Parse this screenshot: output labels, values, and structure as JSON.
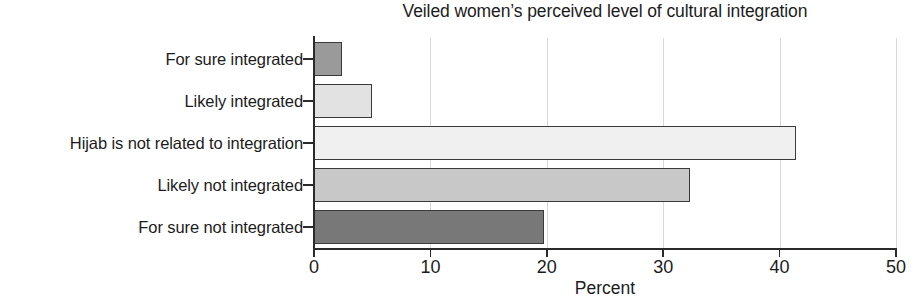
{
  "chart_data": {
    "type": "bar",
    "orientation": "horizontal",
    "title": "Veiled women’s perceived level of cultural integration",
    "xlabel": "Percent",
    "ylabel": "",
    "categories": [
      "For sure integrated",
      "Likely integrated",
      "Hijab is not related to integration",
      "Likely not integrated",
      "For sure not integrated"
    ],
    "values": [
      2.4,
      5.0,
      41.4,
      32.3,
      19.8
    ],
    "bar_colors": [
      "#9a9a9a",
      "#e2e2e2",
      "#f0f0f0",
      "#c8c8c8",
      "#787878"
    ],
    "bar_edge_color": "#3a3a3a",
    "xlim": [
      0,
      50
    ],
    "xticks": [
      0,
      10,
      20,
      30,
      40,
      50
    ],
    "xtick_labels": [
      "0",
      "10",
      "20",
      "30",
      "40",
      "50"
    ],
    "grid": "vertical",
    "grid_color": "#d8d8d8",
    "legend": "none",
    "axis_color": "#2b2b2b"
  }
}
